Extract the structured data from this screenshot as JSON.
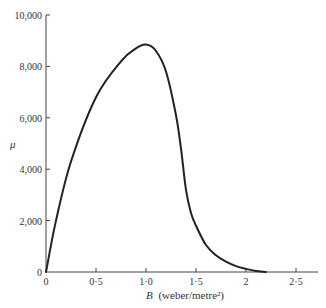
{
  "chart_data": {
    "type": "line",
    "title": "",
    "xlabel": "B (weber/metre²)",
    "xlabel_symbol": "B",
    "xlabel_unit": "(weber/metre²)",
    "ylabel": "μ",
    "xlim": [
      0,
      2.6
    ],
    "ylim": [
      0,
      10000
    ],
    "grid": false,
    "legend": null,
    "x_ticks": [
      {
        "value": 0,
        "label": "0"
      },
      {
        "value": 0.5,
        "label": "0·5"
      },
      {
        "value": 1.0,
        "label": "1·0"
      },
      {
        "value": 1.5,
        "label": "1·5"
      },
      {
        "value": 2.0,
        "label": "2"
      },
      {
        "value": 2.5,
        "label": "2·5"
      }
    ],
    "y_ticks": [
      {
        "value": 0,
        "label": "0"
      },
      {
        "value": 2000,
        "label": "2,000"
      },
      {
        "value": 4000,
        "label": "4,000"
      },
      {
        "value": 6000,
        "label": "6,000"
      },
      {
        "value": 8000,
        "label": "8,000"
      },
      {
        "value": 10000,
        "label": "10,000"
      }
    ],
    "series": [
      {
        "name": "μ vs B",
        "x": [
          0,
          0.1,
          0.25,
          0.5,
          0.75,
          0.9,
          1.0,
          1.1,
          1.2,
          1.3,
          1.35,
          1.4,
          1.45,
          1.5,
          1.6,
          1.7,
          1.8,
          1.9,
          2.0,
          2.1,
          2.2
        ],
        "y": [
          0,
          2000,
          4300,
          6800,
          8200,
          8700,
          8850,
          8600,
          7800,
          6100,
          4800,
          3200,
          2300,
          1800,
          1050,
          650,
          400,
          230,
          120,
          40,
          0
        ]
      }
    ],
    "line_color": "#222222"
  }
}
